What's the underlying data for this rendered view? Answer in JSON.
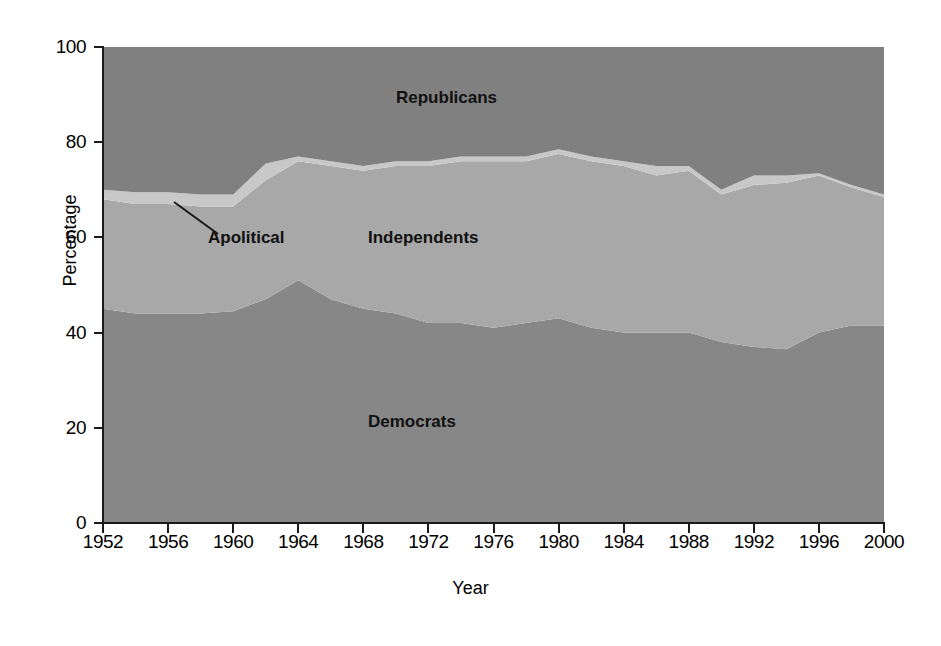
{
  "chart_data": {
    "type": "area",
    "stacked": true,
    "title": "",
    "xlabel": "Year",
    "ylabel": "Percentage",
    "ylim": [
      0,
      100
    ],
    "xlim": [
      1952,
      2000
    ],
    "grid": false,
    "legend_position": "in-plot-labels",
    "ytick_labels": [
      "0",
      "20",
      "40",
      "60",
      "80",
      "100"
    ],
    "ytick_values": [
      0,
      20,
      40,
      60,
      80,
      100
    ],
    "xtick_labels": [
      "1952",
      "1956",
      "1960",
      "1964",
      "1968",
      "1972",
      "1976",
      "1980",
      "1984",
      "1988",
      "1992",
      "1996",
      "2000"
    ],
    "xtick_values": [
      1952,
      1956,
      1960,
      1964,
      1968,
      1972,
      1976,
      1980,
      1984,
      1988,
      1992,
      1996,
      2000
    ],
    "x": [
      1952,
      1954,
      1956,
      1958,
      1960,
      1962,
      1964,
      1966,
      1968,
      1970,
      1972,
      1974,
      1976,
      1978,
      1980,
      1982,
      1984,
      1986,
      1988,
      1990,
      1992,
      1994,
      1996,
      1998,
      2000
    ],
    "series": [
      {
        "name": "Democrats",
        "color": "#878787",
        "values": [
          45,
          44,
          44,
          44,
          44.5,
          47,
          51,
          47,
          45,
          44,
          42,
          42,
          41,
          42,
          43,
          41,
          40,
          40,
          40,
          38,
          37,
          36.5,
          40,
          41.5,
          41.5
        ]
      },
      {
        "name": "Independents",
        "color": "#a8a8a8",
        "values": [
          23,
          23,
          23,
          22.5,
          22,
          25,
          25,
          28,
          29,
          31,
          33,
          34,
          35,
          34,
          34.5,
          35,
          35,
          33,
          34,
          31,
          34,
          35,
          33,
          29,
          27
        ]
      },
      {
        "name": "Apolitical",
        "color": "#c8c8c8",
        "values": [
          2,
          2.5,
          2.5,
          2.5,
          2.5,
          3.5,
          1,
          1,
          1,
          1,
          1,
          1,
          1,
          1,
          1,
          1,
          1,
          2,
          1,
          1,
          2,
          1.5,
          0.5,
          0.5,
          0.5
        ]
      },
      {
        "name": "Republicans",
        "color": "#808080",
        "values": [
          30,
          30.5,
          30.5,
          31,
          31,
          24.5,
          23,
          24,
          25,
          24,
          24,
          23,
          23,
          23,
          21.5,
          23,
          24,
          25,
          25,
          30,
          27,
          27,
          26.5,
          29,
          31
        ]
      }
    ],
    "cumulative_top_boundaries": {
      "democrats_top": [
        45,
        44,
        44,
        44,
        44.5,
        47,
        51,
        47,
        45,
        44,
        42,
        42,
        41,
        42,
        43,
        41,
        40,
        40,
        40,
        38,
        37,
        36.5,
        40,
        41.5,
        41.5
      ],
      "independents_top": [
        68,
        67,
        67,
        66.5,
        66.5,
        72,
        76,
        75,
        74,
        75,
        75,
        76,
        76,
        76,
        77.5,
        76,
        75,
        73,
        74,
        69,
        71,
        71.5,
        73,
        71,
        68.5
      ],
      "apolitical_top": [
        70,
        69.5,
        69.5,
        69,
        69,
        75.5,
        77,
        76,
        75,
        76,
        76,
        77,
        77,
        77,
        78.5,
        77,
        76,
        75,
        75,
        70,
        73,
        73,
        73.5,
        71.5,
        69
      ]
    },
    "annotations": [
      {
        "name": "apolitical-callout",
        "text": "Apolitical",
        "has_leader_line": true
      }
    ],
    "in_plot_labels": {
      "republicans": "Republicans",
      "independents": "Independents",
      "democrats": "Democrats",
      "apolitical": "Apolitical"
    }
  },
  "axes": {
    "y_title": "Percentage",
    "x_title": "Year"
  },
  "colors": {
    "democrats": "#878787",
    "independents": "#a8a8a8",
    "apolitical": "#c8c8c8",
    "republicans": "#808080",
    "axis": "#1a1a1a",
    "background": "#ffffff"
  }
}
